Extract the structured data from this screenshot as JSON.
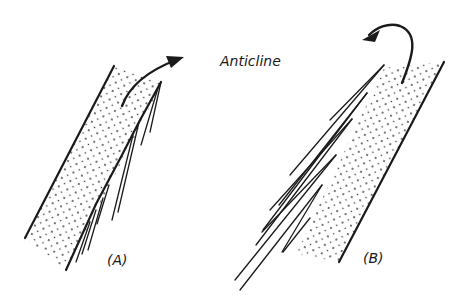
{
  "diagram": {
    "title_label": "Anticline",
    "panels": [
      {
        "id": "A",
        "label": "(A)"
      },
      {
        "id": "B",
        "label": "(B)"
      }
    ],
    "colors": {
      "ink": "#1a1a1a",
      "background": "#ffffff"
    }
  }
}
